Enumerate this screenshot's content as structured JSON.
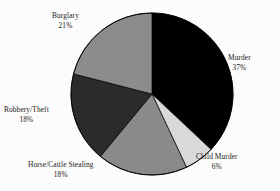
{
  "chart_data": {
    "type": "pie",
    "title": "",
    "subtitle": "",
    "xlabel": "",
    "ylabel": "",
    "legend_position": "none",
    "grid": false,
    "label_format": "category-and-percent",
    "start_angle_deg": 0,
    "direction": "clockwise",
    "categories": [
      "Murder",
      "Child Murder",
      "Horse/Cattle Stealing",
      "Robbery/Theft",
      "Burglary"
    ],
    "values": [
      37,
      6,
      18,
      18,
      21
    ],
    "units": "percent",
    "slices": [
      {
        "label": "Murder",
        "percent": "37%",
        "value": 37,
        "color": "#000000"
      },
      {
        "label": "Child Murder",
        "percent": "6%",
        "value": 6,
        "color": "#d9d9d9"
      },
      {
        "label": "Horse/Cattle Stealing",
        "percent": "18%",
        "value": 18,
        "color": "#8a8a8a"
      },
      {
        "label": "Robbery/Theft",
        "percent": "18%",
        "value": 18,
        "color": "#2b2b2b"
      },
      {
        "label": "Burglary",
        "percent": "21%",
        "value": 21,
        "color": "#8c8c8c"
      }
    ]
  },
  "colors": {
    "background": "#fcfcfc",
    "text": "#1a1a1a",
    "outline": "#000000"
  }
}
